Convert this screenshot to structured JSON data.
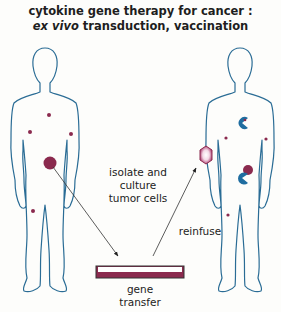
{
  "title": {
    "line1": "cytokine gene therapy for cancer :",
    "line2_italic": "ex vivo",
    "line2_rest": " transduction, vaccination"
  },
  "labels": {
    "isolate": [
      "isolate and",
      "culture",
      "tumor cells"
    ],
    "reinfuse": "reinfuse",
    "gene_transfer": [
      "gene",
      "transfer"
    ]
  },
  "colors": {
    "body_outline": "#2a6c95",
    "tumor": "#8b2a4e",
    "immune_cell": "#1f6da0",
    "dish_fill": "#8b2a4e",
    "arrow": "#333333",
    "background": "#fdfdfb"
  }
}
